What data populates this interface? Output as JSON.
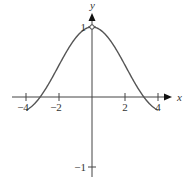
{
  "chart_data": {
    "type": "line",
    "title": "",
    "xlabel": "x",
    "ylabel": "y",
    "xlim": [
      -4.5,
      5
    ],
    "ylim": [
      -1.1,
      1.3
    ],
    "grid": false,
    "legend": null,
    "x_ticks": [
      -4,
      -2,
      2,
      4
    ],
    "x_tick_labels": [
      "−4",
      "−2",
      "2",
      "4"
    ],
    "y_ticks": [
      1,
      -1
    ],
    "y_tick_labels": [
      "1",
      "−1"
    ],
    "function": "sin(x)/x",
    "domain": [
      -4,
      4
    ],
    "annotations": [
      {
        "type": "open-circle",
        "x": 0,
        "y": 1,
        "note": "removable discontinuity"
      }
    ],
    "series": [
      {
        "name": "sin(x)/x",
        "x": [
          -4,
          -3.5,
          -3,
          -2.5,
          -2,
          -1.5,
          -1,
          -0.5,
          0,
          0.5,
          1,
          1.5,
          2,
          2.5,
          3,
          3.5,
          4
        ],
        "y": [
          -0.189,
          -0.1,
          0.047,
          0.239,
          0.455,
          0.665,
          0.841,
          0.959,
          1.0,
          0.959,
          0.841,
          0.665,
          0.455,
          0.239,
          0.047,
          -0.1,
          -0.189
        ]
      }
    ]
  },
  "colors": {
    "curve": "#555555",
    "axis": "#444444",
    "text": "#333333"
  }
}
